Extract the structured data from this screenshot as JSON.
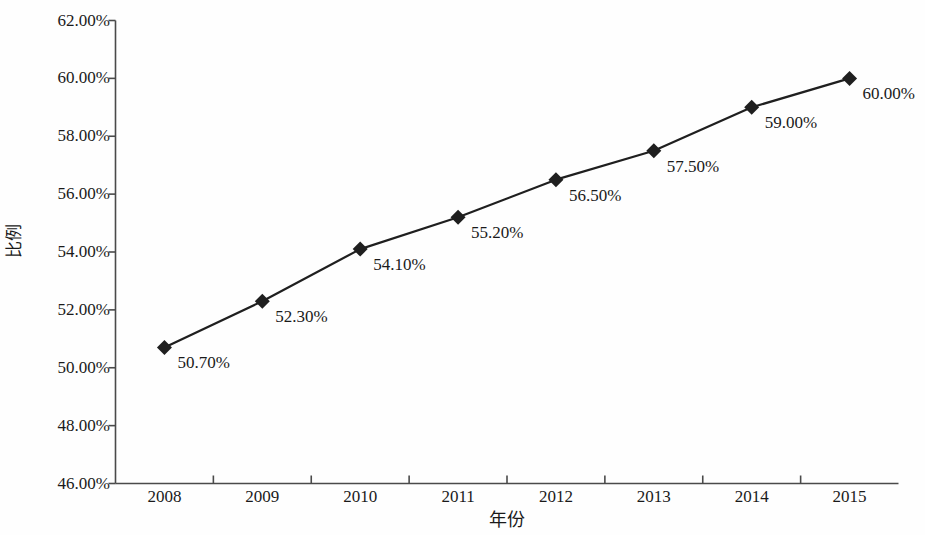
{
  "chart_data": {
    "type": "line",
    "title": "",
    "subtitle": "",
    "xlabel": "年份",
    "ylabel": "比例",
    "categories": [
      "2008",
      "2009",
      "2010",
      "2011",
      "2012",
      "2013",
      "2014",
      "2015"
    ],
    "values": [
      50.7,
      52.3,
      54.1,
      55.2,
      56.5,
      57.5,
      59.0,
      60.0
    ],
    "point_labels": [
      "50.70%",
      "52.30%",
      "54.10%",
      "55.20%",
      "56.50%",
      "57.50%",
      "59.00%",
      "60.00%"
    ],
    "ylim": [
      46.0,
      62.0
    ],
    "ytick_values": [
      62.0,
      60.0,
      58.0,
      56.0,
      54.0,
      52.0,
      50.0,
      48.0,
      46.0
    ],
    "ytick_labels": [
      "62.00%",
      "60.00%",
      "58.00%",
      "56.00%",
      "54.00%",
      "52.00%",
      "50.00%",
      "48.00%",
      "46.00%"
    ],
    "grid": false,
    "legend": null,
    "legend_position": "none",
    "series": [
      {
        "name": "比例",
        "values": [
          50.7,
          52.3,
          54.1,
          55.2,
          56.5,
          57.5,
          59.0,
          60.0
        ],
        "marker": "diamond",
        "line_color": "#1f1f1f",
        "marker_color": "#1f1f1f"
      }
    ],
    "colors": {
      "line": "#1f1f1f",
      "marker": "#1f1f1f",
      "axis": "#4a4a4a",
      "text": "#1a1a1a",
      "background": "#fefefe"
    }
  }
}
